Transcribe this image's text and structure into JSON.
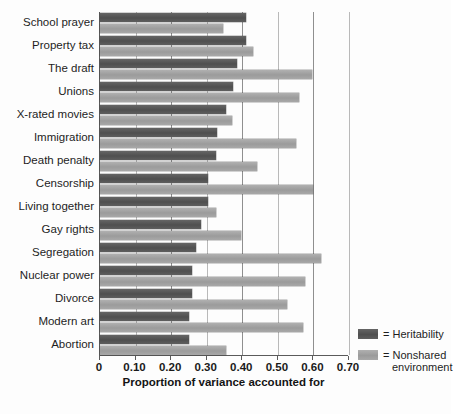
{
  "chart_data": {
    "type": "bar",
    "orientation": "horizontal",
    "title": "",
    "xlabel": "Proportion of variance accounted for",
    "ylabel": "",
    "xlim": [
      0,
      0.7
    ],
    "xticks": [
      0,
      0.1,
      0.2,
      0.3,
      0.4,
      0.5,
      0.6,
      0.7
    ],
    "xtick_labels": [
      "0",
      "0.10",
      "0.20",
      "0.30",
      "0.40",
      "0.50",
      "0.60",
      "0.70"
    ],
    "grid": true,
    "grid_axis": "x",
    "legend_position": "right-bottom",
    "categories": [
      "School prayer",
      "Property tax",
      "The draft",
      "Unions",
      "X-rated movies",
      "Immigration",
      "Death penalty",
      "Censorship",
      "Living together",
      "Gay rights",
      "Segregation",
      "Nuclear power",
      "Divorce",
      "Modern art",
      "Abortion"
    ],
    "series": [
      {
        "name": "Heritability",
        "color": "#5a5a5a",
        "values": [
          0.41,
          0.41,
          0.385,
          0.375,
          0.355,
          0.33,
          0.325,
          0.305,
          0.305,
          0.285,
          0.27,
          0.26,
          0.26,
          0.25,
          0.25
        ]
      },
      {
        "name": "Nonshared environment",
        "color": "#a6a6a6",
        "values": [
          0.345,
          0.43,
          0.595,
          0.56,
          0.37,
          0.55,
          0.44,
          0.6,
          0.325,
          0.395,
          0.62,
          0.575,
          0.525,
          0.57,
          0.355
        ]
      }
    ]
  },
  "legend": {
    "items": [
      {
        "equals": "=",
        "label": "Heritability",
        "label_line2": ""
      },
      {
        "equals": "=",
        "label": "Nonshared",
        "label_line2": "environment"
      }
    ]
  }
}
